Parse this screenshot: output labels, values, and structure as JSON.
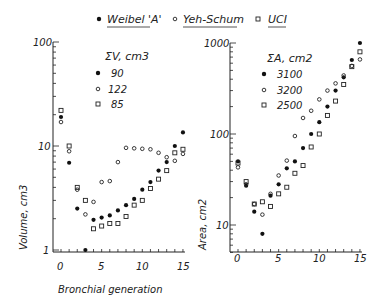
{
  "legend": {
    "items": [
      {
        "marker": "filled-circle",
        "label": "Weibel 'A'"
      },
      {
        "marker": "open-circle",
        "label": "Yeh-Schum"
      },
      {
        "marker": "open-square",
        "label": "UCI"
      }
    ]
  },
  "chart_data": [
    {
      "type": "scatter",
      "title": "",
      "xlabel": "Bronchial generation",
      "ylabel": "Volume, cm3",
      "yscale": "log",
      "ylim": [
        1,
        100
      ],
      "xlim": [
        -1,
        15.5
      ],
      "x_ticks": [
        "0",
        "5",
        "10",
        "15"
      ],
      "y_ticks": [
        "1",
        "10",
        "100"
      ],
      "inset_legend_title": "ΣV, cm3",
      "inset_legend": [
        {
          "series": "Weibel 'A'",
          "value": "90"
        },
        {
          "series": "Yeh-Schum",
          "value": "122"
        },
        {
          "series": "UCI",
          "value": "85"
        }
      ],
      "x": [
        0,
        1,
        2,
        3,
        4,
        5,
        6,
        7,
        8,
        9,
        10,
        11,
        12,
        13,
        14,
        15
      ],
      "series": [
        {
          "name": "Weibel 'A'",
          "marker": "filled-circle",
          "values": [
            19,
            6.9,
            2.5,
            1.0,
            1.95,
            2.05,
            2.15,
            2.4,
            2.7,
            3.1,
            3.8,
            4.5,
            5.8,
            7.0,
            10,
            13.5
          ]
        },
        {
          "name": "Yeh-Schum",
          "marker": "open-circle",
          "values": [
            17,
            8.9,
            3.8,
            2.2,
            2.9,
            4.5,
            4.6,
            7.0,
            9.6,
            9.5,
            9.4,
            9.3,
            8.6,
            7.8,
            7.2,
            8.4
          ]
        },
        {
          "name": "UCI",
          "marker": "open-square",
          "values": [
            22,
            10,
            4.0,
            3.0,
            1.6,
            1.7,
            1.8,
            1.8,
            2.1,
            2.7,
            3.0,
            3.9,
            4.8,
            5.8,
            8.6,
            9.3
          ]
        }
      ]
    },
    {
      "type": "scatter",
      "title": "",
      "xlabel": "",
      "ylabel": "Area, cm2",
      "yscale": "log",
      "ylim": [
        5,
        1000
      ],
      "xlim": [
        -1,
        15.5
      ],
      "x_ticks": [
        "0",
        "5",
        "10",
        "15"
      ],
      "y_ticks": [
        "10",
        "100",
        "1000"
      ],
      "inset_legend_title": "ΣA, cm2",
      "inset_legend": [
        {
          "series": "Weibel 'A'",
          "value": "3100"
        },
        {
          "series": "Yeh-Schum",
          "value": "3200"
        },
        {
          "series": "UCI",
          "value": "2500"
        }
      ],
      "x": [
        0,
        1,
        2,
        3,
        4,
        5,
        6,
        7,
        8,
        9,
        10,
        11,
        12,
        13,
        14,
        15
      ],
      "series": [
        {
          "name": "Weibel 'A'",
          "marker": "filled-circle",
          "values": [
            50,
            27,
            14,
            8,
            21,
            28,
            42,
            50,
            70,
            100,
            135,
            200,
            300,
            420,
            650,
            1000
          ]
        },
        {
          "name": "Yeh-Schum",
          "marker": "open-circle",
          "values": [
            43,
            28,
            17,
            13,
            22,
            35,
            51,
            95,
            150,
            180,
            240,
            300,
            360,
            440,
            560,
            660
          ]
        },
        {
          "name": "UCI",
          "marker": "open-square",
          "values": [
            48,
            30,
            17,
            18,
            16,
            22,
            26,
            37,
            45,
            72,
            100,
            160,
            230,
            350,
            550,
            800
          ]
        }
      ]
    }
  ]
}
